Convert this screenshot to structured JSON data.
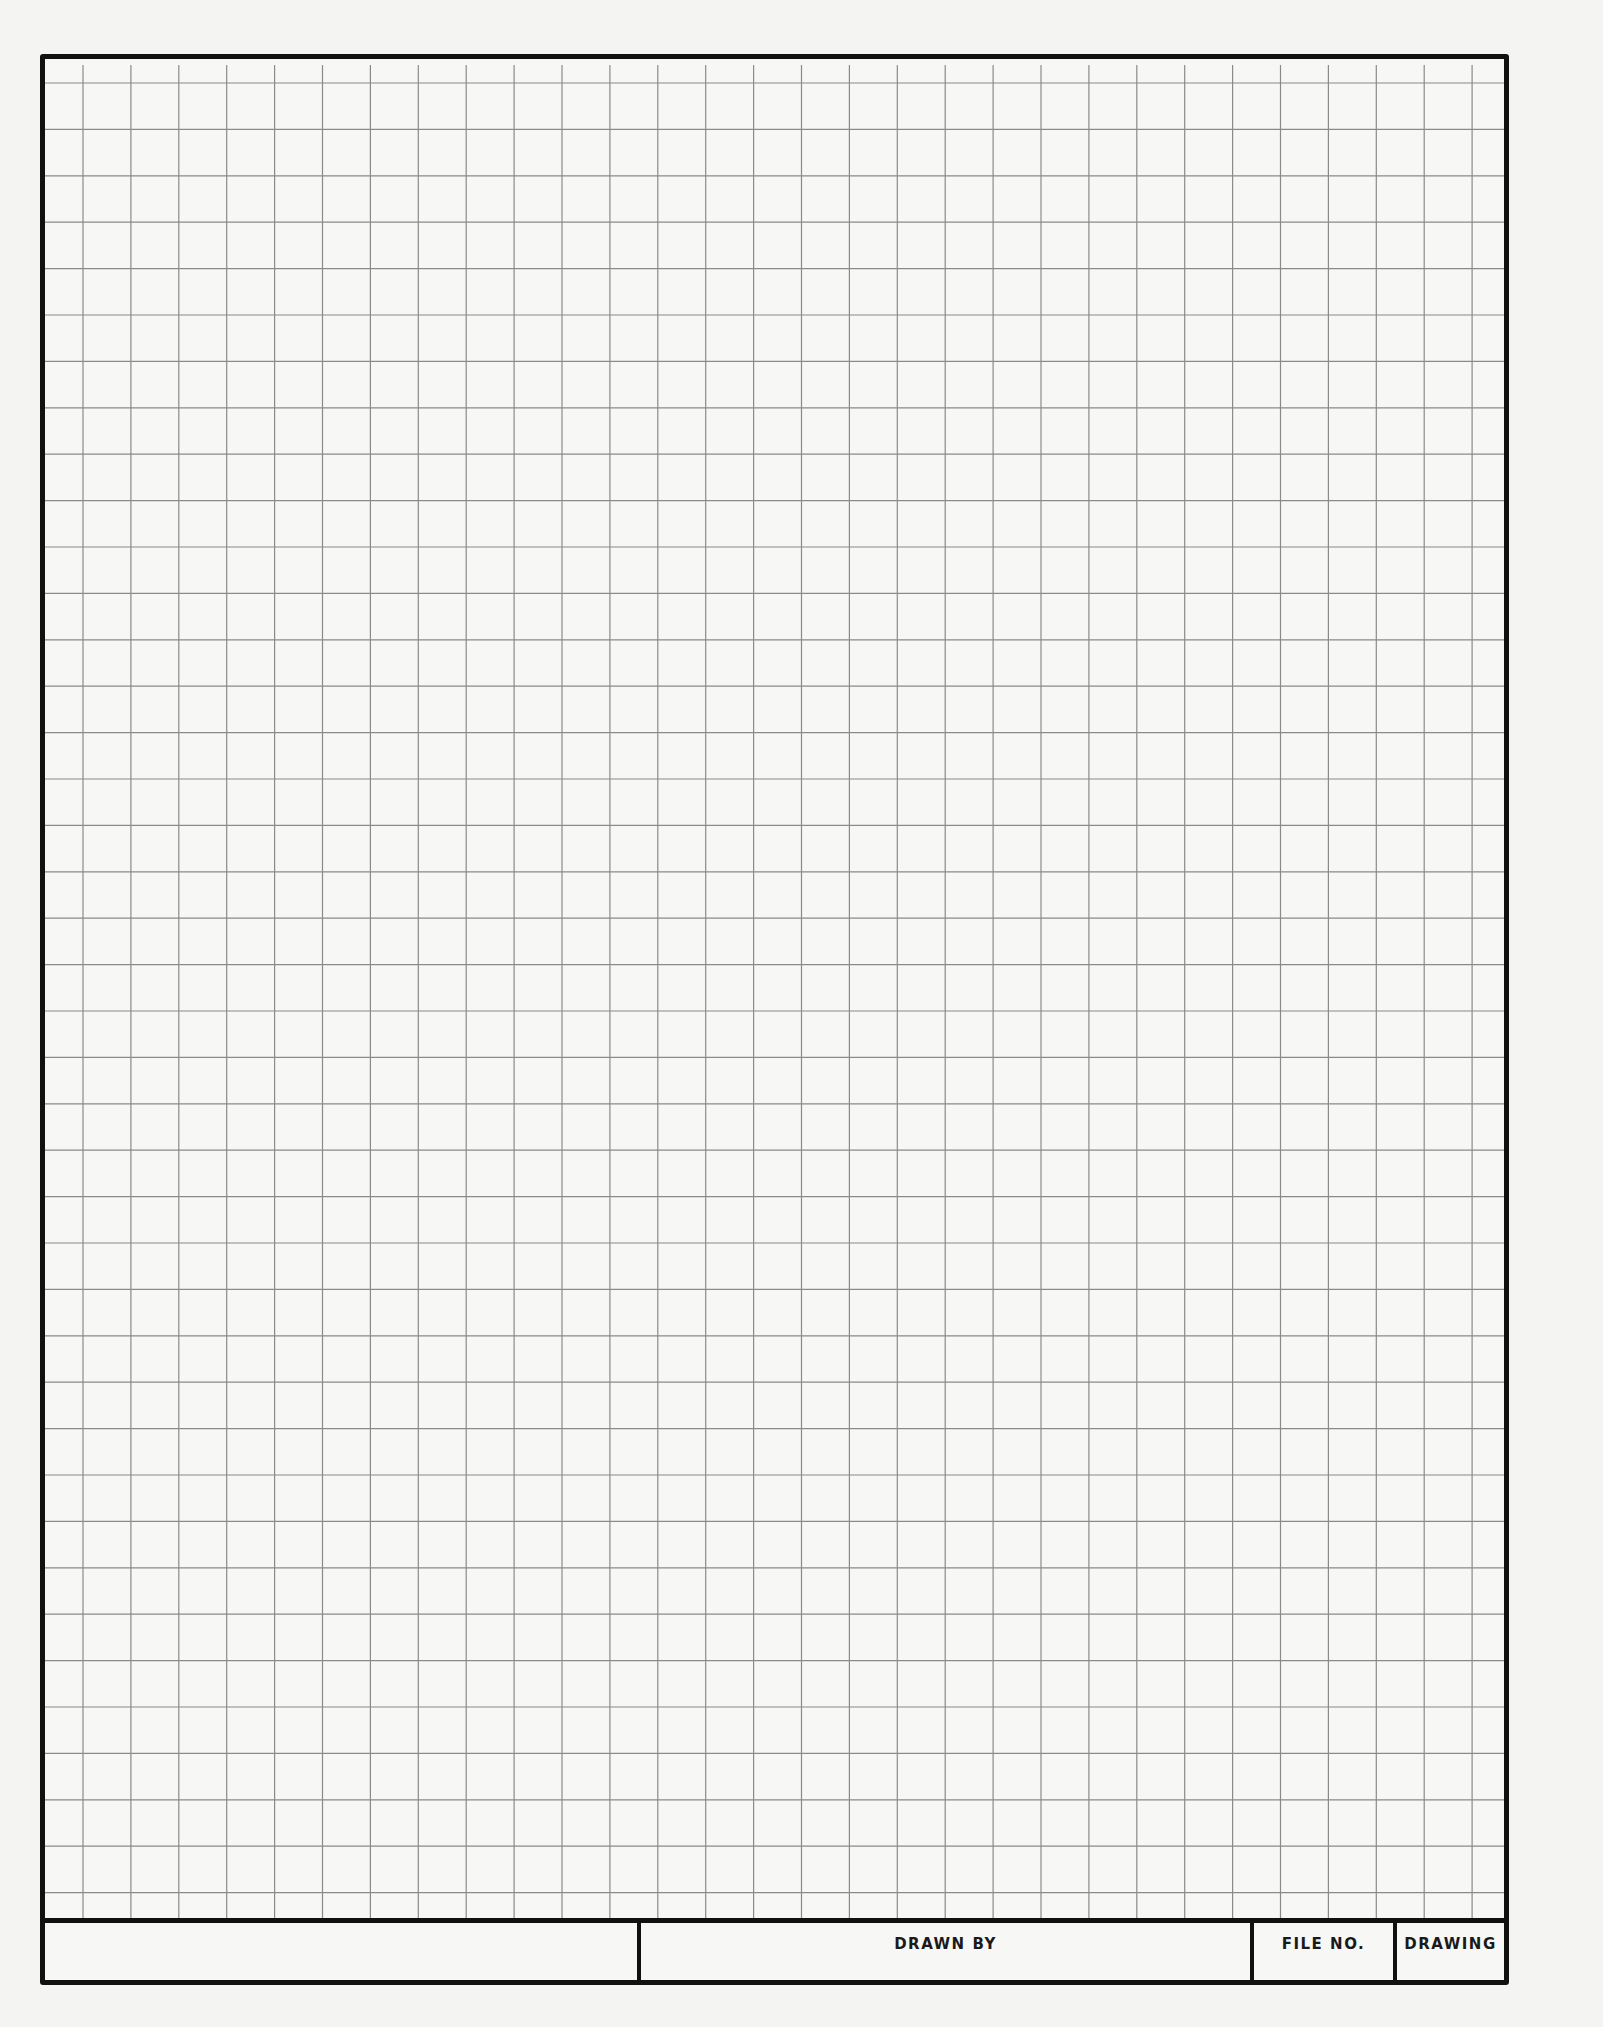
{
  "sheet": {
    "type": "engineering graph paper",
    "grid": {
      "columns": 30,
      "rows": 40,
      "cell_width_px": 47.9,
      "cell_height_px": 46.4,
      "line_color": "#8a8a8a",
      "border_color": "#111111",
      "paper_color": "#f7f7f6"
    }
  },
  "title_block": {
    "fields": [
      {
        "label": ""
      },
      {
        "label": "DRAWN BY"
      },
      {
        "label": "FILE NO."
      },
      {
        "label": "DRAWING"
      }
    ]
  }
}
